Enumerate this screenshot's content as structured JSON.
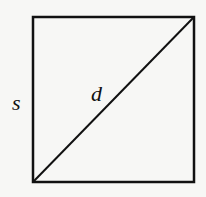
{
  "diagram": {
    "shape": "square",
    "square": {
      "x": 33,
      "y": 17,
      "width": 161,
      "height": 165,
      "stroke": "#111111",
      "stroke_width": 2.5
    },
    "diagonal": {
      "from": "bottom-left",
      "to": "top-right",
      "x1": 33,
      "y1": 182,
      "x2": 194,
      "y2": 17,
      "stroke": "#111111",
      "stroke_width": 2
    },
    "labels": {
      "side": "s",
      "diagonal": "d"
    },
    "background": "#f7f7f5"
  }
}
